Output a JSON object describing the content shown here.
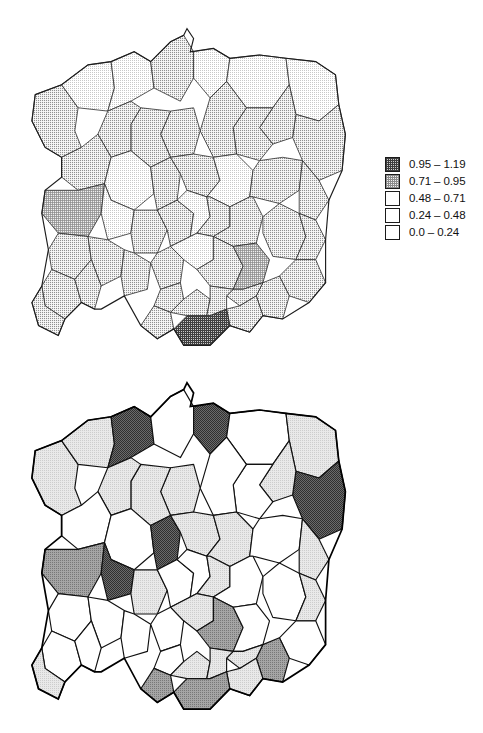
{
  "figure": {
    "panels": [
      {
        "id": "top",
        "name": "upper-choropleth-map",
        "region_count": 49,
        "legend": {
          "name": "legend-upper",
          "entries": [
            {
              "label": "0.95 – 1.19",
              "pattern": "fill-grid-dark",
              "min": 0.95,
              "max": 1.19
            },
            {
              "label": "0.71 – 0.95",
              "pattern": "fill-grid-mid",
              "min": 0.71,
              "max": 0.95
            },
            {
              "label": "0.48 – 0.71",
              "pattern": "fill-stipple-mid",
              "min": 0.48,
              "max": 0.71
            },
            {
              "label": "0.24 – 0.48",
              "pattern": "fill-stipple-light",
              "min": 0.24,
              "max": 0.48
            },
            {
              "label": "0.0 – 0.24",
              "pattern": "fill-none",
              "min": 0.0,
              "max": 0.24
            }
          ]
        }
      },
      {
        "id": "bottom",
        "name": "lower-choropleth-map",
        "region_count": 49,
        "legend": {
          "name": "legend-lower",
          "entries": [
            {
              "label": "≤ 0.14",
              "pattern": "fill-gray-dark",
              "min": null,
              "max": 0.14
            },
            {
              "label": "0.14–0.20",
              "pattern": "fill-gray-pale",
              "min": 0.14,
              "max": 0.2
            },
            {
              "label": "0.20–0.40",
              "pattern": "fill-none",
              "min": 0.2,
              "max": 0.4
            },
            {
              "label": "0.40–0.53",
              "pattern": "fill-none",
              "min": 0.4,
              "max": 0.53
            },
            {
              "label": "> 0.53",
              "pattern": "fill-gray-mid",
              "min": 0.53,
              "max": null
            }
          ]
        }
      }
    ]
  },
  "chart_data": {
    "type": "map",
    "title": "",
    "subtitle": "",
    "projection": "schematic Poland, 49 pre-1999 voivodeships",
    "maps": [
      {
        "panel": "top",
        "classes": [
          "0.95 – 1.19",
          "0.71 – 0.95",
          "0.48 – 0.71",
          "0.24 – 0.48",
          "0.0 – 0.24"
        ],
        "value_range": [
          0.0,
          1.19
        ],
        "class_counts": [
          1,
          2,
          3,
          33,
          10
        ],
        "regions": [
          {
            "id": "szczecin",
            "class": 3
          },
          {
            "id": "koszalin",
            "class": 4
          },
          {
            "id": "slupsk",
            "class": 4
          },
          {
            "id": "gdansk",
            "class": 3
          },
          {
            "id": "elblag",
            "class": 4
          },
          {
            "id": "olsztyn",
            "class": 4
          },
          {
            "id": "suwalki",
            "class": 4
          },
          {
            "id": "bialystok",
            "class": 3
          },
          {
            "id": "lomza",
            "class": 3
          },
          {
            "id": "ostroleka",
            "class": 3
          },
          {
            "id": "ciechanow",
            "class": 3
          },
          {
            "id": "torun",
            "class": 3
          },
          {
            "id": "bydgoszcz",
            "class": 3
          },
          {
            "id": "pila",
            "class": 3
          },
          {
            "id": "gorzow",
            "class": 3
          },
          {
            "id": "poznan",
            "class": 4
          },
          {
            "id": "konin",
            "class": 3
          },
          {
            "id": "plock",
            "class": 3
          },
          {
            "id": "warszawa",
            "class": 4
          },
          {
            "id": "siedlce",
            "class": 3
          },
          {
            "id": "biala-podl",
            "class": 3
          },
          {
            "id": "zielona-gora",
            "class": 2
          },
          {
            "id": "leszno",
            "class": 4
          },
          {
            "id": "kalisz",
            "class": 3
          },
          {
            "id": "sieradz",
            "class": 3
          },
          {
            "id": "lodz",
            "class": 4
          },
          {
            "id": "skierniewice",
            "class": 3
          },
          {
            "id": "radom",
            "class": 3
          },
          {
            "id": "lublin",
            "class": 3
          },
          {
            "id": "chelm",
            "class": 3
          },
          {
            "id": "zamosc",
            "class": 3
          },
          {
            "id": "legnica",
            "class": 3
          },
          {
            "id": "wroclaw",
            "class": 3
          },
          {
            "id": "walbrzych",
            "class": 3
          },
          {
            "id": "opole",
            "class": 3
          },
          {
            "id": "czestochowa",
            "class": 3
          },
          {
            "id": "piotrkow",
            "class": 4
          },
          {
            "id": "kielce",
            "class": 3
          },
          {
            "id": "tarnobrzeg",
            "class": 2
          },
          {
            "id": "przemysl",
            "class": 3
          },
          {
            "id": "rzeszow",
            "class": 3
          },
          {
            "id": "krosno",
            "class": 3
          },
          {
            "id": "katowice",
            "class": 3
          },
          {
            "id": "bielsko",
            "class": 3
          },
          {
            "id": "krakow",
            "class": 3
          },
          {
            "id": "tarnow",
            "class": 3
          },
          {
            "id": "nowy-sacz",
            "class": 1
          },
          {
            "id": "jelenia-gora",
            "class": 3
          },
          {
            "id": "wloclawek",
            "class": 3
          }
        ]
      },
      {
        "panel": "bottom",
        "classes": [
          "≤ 0.14",
          "0.14–0.20",
          "0.20–0.40",
          "0.40–0.53",
          "> 0.53"
        ],
        "value_range": [
          0.0,
          0.9
        ],
        "class_counts": [
          5,
          18,
          20,
          0,
          6
        ],
        "regions": [
          {
            "id": "szczecin",
            "class": 2
          },
          {
            "id": "koszalin",
            "class": 2
          },
          {
            "id": "slupsk",
            "class": 1
          },
          {
            "id": "gdansk",
            "class": 3
          },
          {
            "id": "elblag",
            "class": 1
          },
          {
            "id": "olsztyn",
            "class": 3
          },
          {
            "id": "suwalki",
            "class": 2
          },
          {
            "id": "bialystok",
            "class": 1
          },
          {
            "id": "lomza",
            "class": 2
          },
          {
            "id": "ostroleka",
            "class": 3
          },
          {
            "id": "ciechanow",
            "class": 3
          },
          {
            "id": "torun",
            "class": 2
          },
          {
            "id": "bydgoszcz",
            "class": 2
          },
          {
            "id": "pila",
            "class": 2
          },
          {
            "id": "gorzow",
            "class": 3
          },
          {
            "id": "poznan",
            "class": 3
          },
          {
            "id": "konin",
            "class": 1
          },
          {
            "id": "plock",
            "class": 2
          },
          {
            "id": "warszawa",
            "class": 2
          },
          {
            "id": "siedlce",
            "class": 3
          },
          {
            "id": "biala-podl",
            "class": 2
          },
          {
            "id": "zielona-gora",
            "class": 5
          },
          {
            "id": "leszno",
            "class": 1
          },
          {
            "id": "kalisz",
            "class": 2
          },
          {
            "id": "sieradz",
            "class": 3
          },
          {
            "id": "lodz",
            "class": 3
          },
          {
            "id": "skierniewice",
            "class": 2
          },
          {
            "id": "radom",
            "class": 3
          },
          {
            "id": "lublin",
            "class": 3
          },
          {
            "id": "chelm",
            "class": 2
          },
          {
            "id": "zamosc",
            "class": 3
          },
          {
            "id": "legnica",
            "class": 3
          },
          {
            "id": "wroclaw",
            "class": 3
          },
          {
            "id": "walbrzych",
            "class": 5
          },
          {
            "id": "opole",
            "class": 3
          },
          {
            "id": "czestochowa",
            "class": 3
          },
          {
            "id": "piotrkow",
            "class": 2
          },
          {
            "id": "kielce",
            "class": 5
          },
          {
            "id": "tarnobrzeg",
            "class": 3
          },
          {
            "id": "przemysl",
            "class": 5
          },
          {
            "id": "rzeszow",
            "class": 2
          },
          {
            "id": "krosno",
            "class": 2
          },
          {
            "id": "katowice",
            "class": 3
          },
          {
            "id": "bielsko",
            "class": 5
          },
          {
            "id": "krakow",
            "class": 2
          },
          {
            "id": "tarnow",
            "class": 2
          },
          {
            "id": "nowy-sacz",
            "class": 5
          },
          {
            "id": "jelenia-gora",
            "class": 2
          },
          {
            "id": "wloclawek",
            "class": 2
          }
        ]
      }
    ]
  }
}
